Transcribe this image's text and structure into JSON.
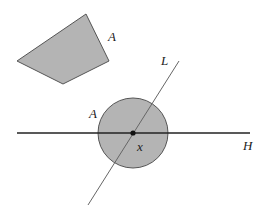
{
  "figure": {
    "width": 266,
    "height": 213,
    "colors": {
      "fill": "#b4b4b4",
      "stroke": "#555555",
      "line": "#222222",
      "thin_line": "#666666",
      "background": "#ffffff"
    },
    "shapes": {
      "quadrilateral": {
        "label": "A",
        "points": "17,61 86,14 109,61 63,84",
        "label_pos": [
          108,
          41
        ]
      },
      "disk": {
        "label": "A",
        "cx": 133,
        "cy": 133,
        "r": 35,
        "label_pos": [
          89,
          118
        ]
      },
      "line_H": {
        "label": "H",
        "x1": 17,
        "y1": 133,
        "x2": 250,
        "y2": 133,
        "label_pos": [
          243,
          150
        ]
      },
      "line_L": {
        "label": "L",
        "x1": 88,
        "y1": 205,
        "x2": 179,
        "y2": 61,
        "label_pos": [
          161,
          65
        ]
      },
      "point_x": {
        "label": "x",
        "cx": 133,
        "cy": 133,
        "label_pos": [
          137,
          151
        ]
      }
    }
  }
}
